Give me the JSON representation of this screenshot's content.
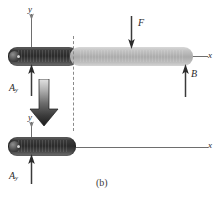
{
  "figure": {
    "caption": "(b)",
    "type": "free-body-diagram",
    "colors": {
      "beam_dark": "#2a2a2a",
      "beam_light": "#ababab",
      "axis": "#6e6e6e",
      "label": "#2b2b2b",
      "dashed": "#8a8a8a"
    }
  },
  "upper_diagram": {
    "axis_y_label": "y",
    "axis_x_label": "x",
    "force_F": {
      "label": "F",
      "direction": "down"
    },
    "force_B": {
      "label": "B",
      "direction": "up"
    },
    "reaction_A": {
      "label": "A",
      "subscript": "y",
      "direction": "up"
    }
  },
  "lower_diagram": {
    "axis_y_label": "y",
    "axis_x_label": "x",
    "reaction_A": {
      "label": "A",
      "subscript": "y",
      "direction": "up"
    },
    "motion_arrow": {
      "direction": "down"
    }
  }
}
